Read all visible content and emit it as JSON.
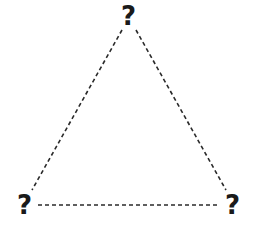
{
  "diagram": {
    "type": "triangle",
    "edge_style": "dashed",
    "edge_color": "#2a2a2a",
    "vertices": [
      {
        "id": "top",
        "label": "?"
      },
      {
        "id": "bottom-left",
        "label": "?"
      },
      {
        "id": "bottom-right",
        "label": "?"
      }
    ],
    "edges": [
      {
        "from": "top",
        "to": "bottom-left"
      },
      {
        "from": "top",
        "to": "bottom-right"
      },
      {
        "from": "bottom-left",
        "to": "bottom-right"
      }
    ]
  }
}
